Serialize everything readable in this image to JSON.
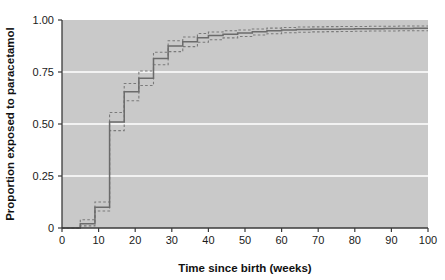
{
  "chart_data": {
    "type": "line",
    "title": "",
    "subtitle": "",
    "xlabel": "Time since birth (weeks)",
    "ylabel": "Proportion exposed to paracetamol",
    "xlim": [
      0,
      100
    ],
    "ylim": [
      0,
      1.0
    ],
    "grid": true,
    "grid_color": "#ffffff",
    "grid_axis": "y",
    "legend_position": "none",
    "plot_background": "#c9c9c9",
    "figure_background": "#ffffff",
    "line_color": "#6b6b6b",
    "ci_color": "#7a7a7a",
    "xticks": [
      0,
      10,
      20,
      30,
      40,
      50,
      60,
      70,
      80,
      90,
      100
    ],
    "xtick_labels": [
      "0",
      "10",
      "20",
      "30",
      "40",
      "50",
      "60",
      "70",
      "80",
      "90",
      "100"
    ],
    "yticks": [
      0,
      0.25,
      0.5,
      0.75,
      1.0
    ],
    "ytick_labels": [
      "0",
      "0.25",
      "0.50",
      "0.75",
      "1.00"
    ],
    "series": [
      {
        "name": "Cumulative proportion exposed",
        "style": "step-solid",
        "x": [
          0,
          4,
          5,
          8,
          9,
          12,
          13,
          16,
          17,
          20,
          21,
          24,
          25,
          28,
          29,
          32,
          33,
          36,
          37,
          40,
          44,
          48,
          52,
          56,
          60,
          64,
          68,
          72,
          76,
          80,
          84,
          88,
          92,
          96,
          100
        ],
        "y": [
          0.0,
          0.0,
          0.02,
          0.02,
          0.1,
          0.1,
          0.51,
          0.51,
          0.655,
          0.655,
          0.72,
          0.72,
          0.815,
          0.815,
          0.875,
          0.875,
          0.895,
          0.895,
          0.915,
          0.925,
          0.932,
          0.938,
          0.943,
          0.948,
          0.952,
          0.954,
          0.955,
          0.956,
          0.957,
          0.958,
          0.958,
          0.959,
          0.959,
          0.96,
          0.96
        ]
      },
      {
        "name": "Upper 95% confidence limit",
        "style": "step-dashed",
        "x": [
          0,
          4,
          5,
          8,
          9,
          12,
          13,
          16,
          17,
          20,
          21,
          24,
          25,
          28,
          29,
          32,
          33,
          36,
          37,
          40,
          44,
          48,
          52,
          56,
          60,
          64,
          68,
          72,
          76,
          80,
          84,
          88,
          92,
          96,
          100
        ],
        "y": [
          0.0,
          0.0,
          0.04,
          0.04,
          0.125,
          0.125,
          0.555,
          0.555,
          0.695,
          0.695,
          0.755,
          0.755,
          0.845,
          0.845,
          0.9,
          0.9,
          0.918,
          0.918,
          0.935,
          0.942,
          0.948,
          0.952,
          0.957,
          0.961,
          0.964,
          0.966,
          0.967,
          0.968,
          0.969,
          0.969,
          0.97,
          0.97,
          0.971,
          0.971,
          0.971
        ]
      },
      {
        "name": "Lower 95% confidence limit",
        "style": "step-dashed",
        "x": [
          0,
          4,
          5,
          8,
          9,
          12,
          13,
          16,
          17,
          20,
          21,
          24,
          25,
          28,
          29,
          32,
          33,
          36,
          37,
          40,
          44,
          48,
          52,
          56,
          60,
          64,
          68,
          72,
          76,
          80,
          84,
          88,
          92,
          96,
          100
        ],
        "y": [
          0.0,
          0.0,
          0.01,
          0.01,
          0.082,
          0.082,
          0.468,
          0.468,
          0.612,
          0.612,
          0.685,
          0.685,
          0.785,
          0.785,
          0.848,
          0.848,
          0.872,
          0.872,
          0.893,
          0.905,
          0.914,
          0.921,
          0.928,
          0.934,
          0.939,
          0.941,
          0.943,
          0.944,
          0.945,
          0.946,
          0.947,
          0.947,
          0.948,
          0.948,
          0.948
        ]
      }
    ]
  }
}
